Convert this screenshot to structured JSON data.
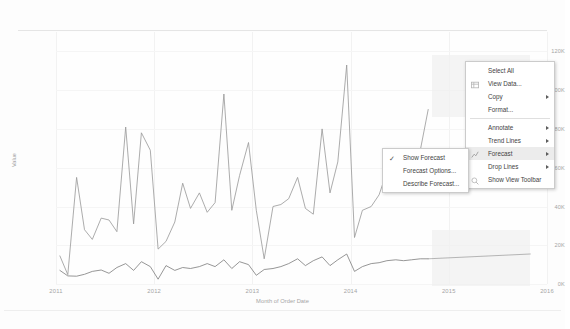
{
  "chart_data": {
    "type": "line",
    "title": "",
    "xlabel": "Month of Order Date",
    "ylabel": "Value",
    "ylim": [
      0,
      130000
    ],
    "yticks": [
      "0K",
      "20K",
      "40K",
      "60K",
      "80K",
      "100K",
      "120K"
    ],
    "ytick_values": [
      0,
      20000,
      40000,
      60000,
      80000,
      100000,
      120000
    ],
    "xticks": [
      "2011",
      "2012",
      "2013",
      "2014",
      "2015",
      "2016"
    ],
    "xtick_values": [
      2011,
      2012,
      2013,
      2014,
      2015,
      2016
    ],
    "grid": true,
    "legend_position": "none",
    "forecast": {
      "enabled": true,
      "start": 2014.83,
      "end": 2015.83,
      "band_label": "forecast confidence band"
    },
    "series": [
      {
        "name": "Sales",
        "color": "#8c8c8c",
        "x": [
          2011.04,
          2011.12,
          2011.21,
          2011.29,
          2011.37,
          2011.46,
          2011.54,
          2011.62,
          2011.71,
          2011.79,
          2011.87,
          2011.96,
          2012.04,
          2012.12,
          2012.21,
          2012.29,
          2012.37,
          2012.46,
          2012.54,
          2012.62,
          2012.71,
          2012.79,
          2012.87,
          2012.96,
          2013.04,
          2013.12,
          2013.21,
          2013.29,
          2013.37,
          2013.46,
          2013.54,
          2013.62,
          2013.71,
          2013.79,
          2013.87,
          2013.96,
          2014.04,
          2014.12,
          2014.21,
          2014.29,
          2014.37,
          2014.46,
          2014.54,
          2014.62,
          2014.71,
          2014.79
        ],
        "values": [
          14500,
          4800,
          55000,
          28000,
          23000,
          34000,
          33000,
          27000,
          81000,
          31000,
          78000,
          69000,
          18000,
          22000,
          32000,
          52000,
          39000,
          47000,
          37000,
          42000,
          98000,
          38000,
          56000,
          73000,
          38000,
          13000,
          40000,
          41000,
          44000,
          55000,
          39000,
          36000,
          80000,
          47000,
          63000,
          113000,
          24000,
          38000,
          40000,
          46000,
          58000,
          60000,
          66000,
          52000,
          69000,
          90000
        ]
      },
      {
        "name": "Profit",
        "color": "#6f6f6f",
        "x": [
          2011.04,
          2011.12,
          2011.21,
          2011.29,
          2011.37,
          2011.46,
          2011.54,
          2011.62,
          2011.71,
          2011.79,
          2011.87,
          2011.96,
          2012.04,
          2012.12,
          2012.21,
          2012.29,
          2012.37,
          2012.46,
          2012.54,
          2012.62,
          2012.71,
          2012.79,
          2012.87,
          2012.96,
          2013.04,
          2013.12,
          2013.21,
          2013.29,
          2013.37,
          2013.46,
          2013.54,
          2013.62,
          2013.71,
          2013.79,
          2013.87,
          2013.96,
          2014.04,
          2014.12,
          2014.21,
          2014.29,
          2014.37,
          2014.46,
          2014.54,
          2014.62,
          2014.71,
          2014.79
        ],
        "values": [
          7000,
          4200,
          4000,
          5000,
          6500,
          7200,
          5500,
          8500,
          10500,
          7000,
          11500,
          9000,
          2500,
          9500,
          7000,
          8500,
          8000,
          9000,
          10500,
          9000,
          12500,
          8000,
          11500,
          10000,
          4500,
          7500,
          8000,
          9000,
          10500,
          13000,
          9500,
          12000,
          14000,
          9500,
          12500,
          15500,
          6500,
          9000,
          10500,
          11000,
          12000,
          12500,
          12000,
          12500,
          13000,
          13000
        ]
      },
      {
        "name": "Profit Forecast",
        "color": "#8a8a8a",
        "forecast": true,
        "x": [
          2014.79,
          2015.83
        ],
        "values": [
          13000,
          15500
        ]
      }
    ]
  },
  "context_menu": {
    "name": "chart-context-menu",
    "items": [
      {
        "label": "Select All",
        "icon": "none",
        "arrow": false,
        "sep_after": false
      },
      {
        "label": "View Data...",
        "icon": "table-icon",
        "arrow": false,
        "sep_after": false
      },
      {
        "label": "Copy",
        "icon": "none",
        "arrow": true,
        "sep_after": false
      },
      {
        "label": "Format...",
        "icon": "none",
        "arrow": false,
        "sep_after": true
      },
      {
        "label": "Annotate",
        "icon": "none",
        "arrow": true,
        "sep_after": false
      },
      {
        "label": "Trend Lines",
        "icon": "none",
        "arrow": true,
        "sep_after": false
      },
      {
        "label": "Forecast",
        "icon": "forecast-icon",
        "arrow": true,
        "sep_after": false,
        "highlighted": true
      },
      {
        "label": "Drop Lines",
        "icon": "none",
        "arrow": true,
        "sep_after": false
      },
      {
        "label": "Show View Toolbar",
        "icon": "search-icon",
        "arrow": false,
        "sep_after": false
      }
    ]
  },
  "forecast_submenu": {
    "name": "forecast-submenu",
    "items": [
      {
        "label": "Show Forecast",
        "checked": true
      },
      {
        "label": "Forecast Options...",
        "checked": false
      },
      {
        "label": "Describe Forecast...",
        "checked": false
      }
    ]
  },
  "colors": {
    "background": "#fdfdfd",
    "plot_background": "#fefefe",
    "gridline": "#f2f2f2",
    "axis_text": "#9a9a9a",
    "series_primary": "#8c8c8c",
    "series_secondary": "#6f6f6f",
    "forecast_band": "#efefef",
    "menu_background": "#ffffff",
    "menu_border": "#c6c6c6",
    "menu_highlight": "#eaeaea",
    "menu_text": "#2b2b2b"
  }
}
